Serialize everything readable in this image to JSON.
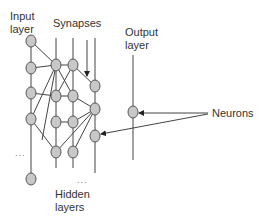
{
  "labels": {
    "input_line1": "Input",
    "input_line2": "layer",
    "synapses": "Synapses",
    "output_line1": "Output",
    "output_line2": "layer",
    "neurons": "Neurons",
    "hidden_line1": "Hidden",
    "hidden_line2": "layers",
    "ellipsis_input": "...",
    "ellipsis_hidden": "..."
  },
  "colors": {
    "node_fill": "#c8c8c8",
    "node_stroke": "#555555",
    "line": "#444444",
    "text": "#333333"
  },
  "layers": [
    {
      "name": "input",
      "nodes": 5,
      "has_ellipsis": true
    },
    {
      "name": "hidden-1",
      "nodes": 3
    },
    {
      "name": "hidden-2",
      "nodes": 3
    },
    {
      "name": "hidden-3",
      "nodes": 3
    },
    {
      "name": "output",
      "nodes": 1
    }
  ]
}
